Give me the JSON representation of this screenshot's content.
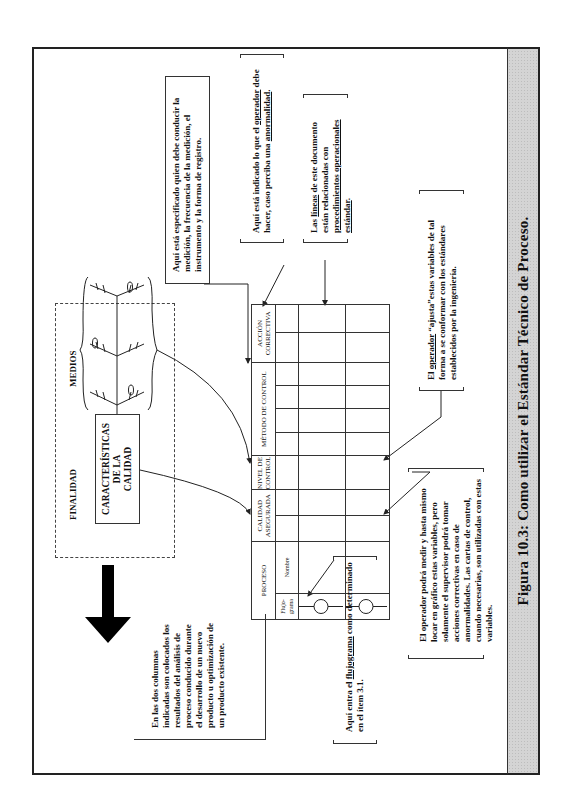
{
  "figure": {
    "caption": "Figura 10.3: Como utilizar el Estándar Técnico de Proceso.",
    "colors": {
      "frame": "#222222",
      "caption_band": "#d4d4d4",
      "ink": "#111111",
      "arrow_fill": "#000000"
    }
  },
  "goal_box": {
    "finalidad_label": "FINALIDAD",
    "medios_label": "MEDIOS",
    "quality_box_lines": [
      "CARACTERÍSTICAS",
      "DE LA",
      "CALIDAD"
    ]
  },
  "table": {
    "headers": [
      {
        "label": "PROCESO",
        "subheaders": [
          "Flujo-grama",
          "Nombre"
        ]
      },
      {
        "label": "CALIDAD ASEGURADA"
      },
      {
        "label": "NIVEL DE CONTROL"
      },
      {
        "label": "MÉTODO DE CONTROL"
      },
      {
        "label": "ACCIÓN CORRECTIVA"
      }
    ],
    "flowchart_symbols": [
      "circle",
      "circle"
    ],
    "data_rows": 2
  },
  "callouts": {
    "measurement": "Aquí está especificado quien debe conducir la medición, la frecuencia de la medición, el instrumento y la forma de registro.",
    "corrective_pre": "Aquí está indicado lo que el ",
    "corrective_u1": "operador",
    "corrective_mid": " debe hacer, caso perciba una ",
    "corrective_u2": "anormalidad",
    "corrective_post": ".",
    "lines_pre": "Las ",
    "lines_u1": "líneas",
    "lines_mid": " de este documento están relacionadas con ",
    "lines_u2": "procedimientos operacionales estándar",
    "lines_post": ".",
    "operator_pre": "El ",
    "operator_u1": "operador",
    "operator_post": " “ajusta”estas variables de tal forma a se conformar con los estándares establecidos por la ingeniería.",
    "supervisor": "El operador podrá medir y hasta mismo locar en gráfico estas variables, pero solamente el supervisor podrá tomar acciones correctivas en caso de anormalidades. Las cartas de control, cuando necesarias, son utilizadas con estas variables.",
    "flowchart_pre": "Aquí entra el ",
    "flowchart_u1": "flujograma",
    "flowchart_post": " como determinado en el ítem 3.1.",
    "columns": "En las dos columnas indicadas son colocados los resultados del análisis de proceso conducido durante el desarrollo de un nuevo producto u optimización de un producto existente."
  },
  "icons": {
    "big_arrow": "arrow-up-icon (points toward quality goal)",
    "fishbone": "fishbone-diagram-icon"
  }
}
